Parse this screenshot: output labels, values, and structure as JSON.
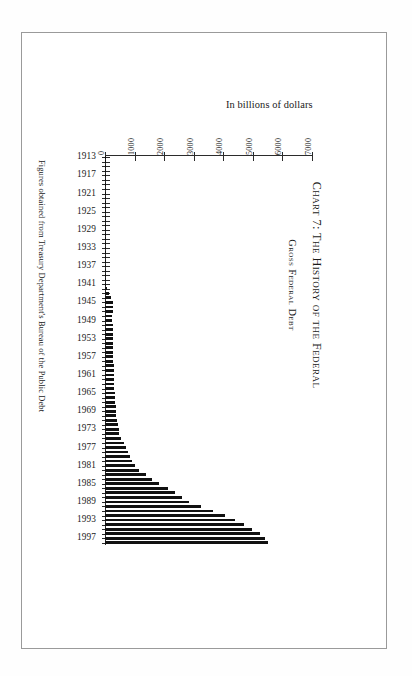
{
  "page": {
    "frame_label": "chart-page-frame"
  },
  "title": {
    "main": "Chart 7: The History of the Federal",
    "sub": "Gross Federal Debt"
  },
  "footnote": {
    "text": "Figures obtained from Treasury Department's Bureau of the Public Debt"
  },
  "chart_data": {
    "type": "bar",
    "orientation": "horizontal",
    "title": "Chart 7: The History of the Federal Gross Federal Debt",
    "subtitle": "Gross Federal Debt",
    "xlabel": "In billions of dollars",
    "ylabel": "",
    "axis_caption": "In billions of dollars",
    "xlim": [
      0,
      7000
    ],
    "ylim_categories": [
      "1913",
      "1998"
    ],
    "grid": false,
    "legend": null,
    "xticks": [
      0,
      1000,
      2000,
      3000,
      4000,
      5000,
      6000,
      7000
    ],
    "xtick_labels": [
      "0",
      "1000",
      "2000",
      "3000",
      "4000",
      "5000",
      "6000",
      "7000"
    ],
    "ytick_labels": [
      "1913",
      "1917",
      "1921",
      "1925",
      "1929",
      "1933",
      "1937",
      "1941",
      "1945",
      "1949",
      "1953",
      "1957",
      "1961",
      "1965",
      "1969",
      "1973",
      "1977",
      "1981",
      "1985",
      "1989",
      "1993",
      "1997"
    ],
    "ytick_interval_years": 4,
    "note": "Values are United States gross federal debt, in billions of dollars, fiscal years 1913-1998.",
    "categories": [
      "1913",
      "1914",
      "1915",
      "1916",
      "1917",
      "1918",
      "1919",
      "1920",
      "1921",
      "1922",
      "1923",
      "1924",
      "1925",
      "1926",
      "1927",
      "1928",
      "1929",
      "1930",
      "1931",
      "1932",
      "1933",
      "1934",
      "1935",
      "1936",
      "1937",
      "1938",
      "1939",
      "1940",
      "1941",
      "1942",
      "1943",
      "1944",
      "1945",
      "1946",
      "1947",
      "1948",
      "1949",
      "1950",
      "1951",
      "1952",
      "1953",
      "1954",
      "1955",
      "1956",
      "1957",
      "1958",
      "1959",
      "1960",
      "1961",
      "1962",
      "1963",
      "1964",
      "1965",
      "1966",
      "1967",
      "1968",
      "1969",
      "1970",
      "1971",
      "1972",
      "1973",
      "1974",
      "1975",
      "1976",
      "1977",
      "1978",
      "1979",
      "1980",
      "1981",
      "1982",
      "1983",
      "1984",
      "1985",
      "1986",
      "1987",
      "1988",
      "1989",
      "1990",
      "1991",
      "1992",
      "1993",
      "1994",
      "1995",
      "1996",
      "1997",
      "1998"
    ],
    "values": [
      2.9,
      2.9,
      3.1,
      3.6,
      5.7,
      12.5,
      25.5,
      24.3,
      24.0,
      23.0,
      22.3,
      21.3,
      20.5,
      19.6,
      18.5,
      17.6,
      16.9,
      16.2,
      16.8,
      19.5,
      22.5,
      27.1,
      28.7,
      33.8,
      36.4,
      37.2,
      40.4,
      43.0,
      49.0,
      72.4,
      136.7,
      201.0,
      258.7,
      269.4,
      258.3,
      252.3,
      252.8,
      257.4,
      255.2,
      259.1,
      266.1,
      271.3,
      274.4,
      272.8,
      272.4,
      279.7,
      287.8,
      290.9,
      292.9,
      303.3,
      310.8,
      316.8,
      323.2,
      329.5,
      341.3,
      369.8,
      367.1,
      382.6,
      409.5,
      437.3,
      468.4,
      486.2,
      544.1,
      631.9,
      709.1,
      780.4,
      833.8,
      914.3,
      1003.9,
      1147.0,
      1381.9,
      1576.7,
      1827.5,
      2130.0,
      2355.3,
      2602.3,
      2857.4,
      3233.3,
      3665.3,
      4064.6,
      4411.5,
      4692.8,
      4973.9,
      5224.8,
      5413.1,
      5526.2
    ]
  }
}
